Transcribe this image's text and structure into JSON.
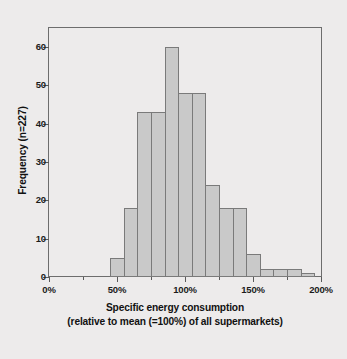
{
  "chart_data": {
    "type": "bar",
    "title": "",
    "subtitle": "",
    "xlabel_line1": "Specific energy consumption",
    "xlabel_line2": "(relative to mean (=100%) of all supermarkets)",
    "ylabel": "Frequency (n=227)",
    "xlim": [
      0,
      200
    ],
    "ylim": [
      0,
      65
    ],
    "grid": false,
    "legend": null,
    "bin_width": 10,
    "n_total": 227,
    "categories": [
      "45-55%",
      "55-65%",
      "65-75%",
      "75-85%",
      "85-95%",
      "95-105%",
      "105-115%",
      "115-125%",
      "125-135%",
      "135-145%",
      "145-155%",
      "155-165%",
      "165-175%",
      "175-185%",
      "185-195%"
    ],
    "bins": [
      {
        "x_start": 45,
        "x_end": 55,
        "value": 5
      },
      {
        "x_start": 55,
        "x_end": 65,
        "value": 18
      },
      {
        "x_start": 65,
        "x_end": 75,
        "value": 43
      },
      {
        "x_start": 75,
        "x_end": 85,
        "value": 43
      },
      {
        "x_start": 85,
        "x_end": 95,
        "value": 60
      },
      {
        "x_start": 95,
        "x_end": 105,
        "value": 48
      },
      {
        "x_start": 105,
        "x_end": 115,
        "value": 48
      },
      {
        "x_start": 115,
        "x_end": 125,
        "value": 24
      },
      {
        "x_start": 125,
        "x_end": 135,
        "value": 18
      },
      {
        "x_start": 135,
        "x_end": 145,
        "value": 18
      },
      {
        "x_start": 145,
        "x_end": 155,
        "value": 6
      },
      {
        "x_start": 155,
        "x_end": 165,
        "value": 2
      },
      {
        "x_start": 165,
        "x_end": 175,
        "value": 2
      },
      {
        "x_start": 175,
        "x_end": 185,
        "value": 2
      },
      {
        "x_start": 185,
        "x_end": 195,
        "value": 1
      }
    ],
    "values": [
      5,
      18,
      43,
      43,
      60,
      48,
      48,
      24,
      18,
      18,
      6,
      2,
      2,
      2,
      1
    ],
    "y_ticks": [
      {
        "value": 0,
        "label": "0"
      },
      {
        "value": 10,
        "label": "10"
      },
      {
        "value": 20,
        "label": "20"
      },
      {
        "value": 30,
        "label": "30"
      },
      {
        "value": 40,
        "label": "40"
      },
      {
        "value": 50,
        "label": "50"
      },
      {
        "value": 60,
        "label": "60"
      }
    ],
    "x_ticks": [
      {
        "value": 0,
        "label": "0%",
        "major": true
      },
      {
        "value": 25,
        "label": "",
        "major": false
      },
      {
        "value": 50,
        "label": "50%",
        "major": true
      },
      {
        "value": 75,
        "label": "",
        "major": false
      },
      {
        "value": 100,
        "label": "100%",
        "major": true
      },
      {
        "value": 125,
        "label": "",
        "major": false
      },
      {
        "value": 150,
        "label": "150%",
        "major": true
      },
      {
        "value": 175,
        "label": "",
        "major": false
      },
      {
        "value": 200,
        "label": "200%",
        "major": true
      }
    ],
    "colors": {
      "bar_fill": "#c9c9c9",
      "bar_border": "#7a7a7a",
      "axis": "#5a5a5a",
      "frame": "#6d6d6d",
      "text": "#1b1b1b",
      "background": "#edebeb"
    }
  }
}
